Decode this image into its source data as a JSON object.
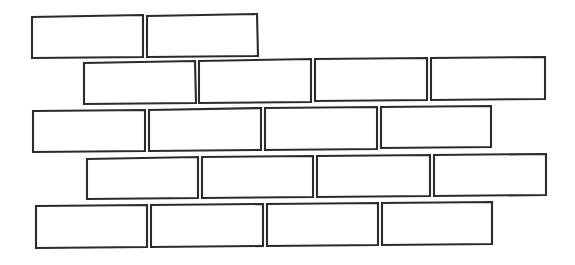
{
  "figure": {
    "name": "brick-wall-diagram",
    "style": "hand-drawn line art",
    "background_color": "#ffffff",
    "stroke_color": "#2b2b2b",
    "fill_color": "#ffffff",
    "stroke_width": 2.1,
    "width": 575,
    "height": 265,
    "row_count": 5,
    "brick_count": 18,
    "bond_pattern": "running-bond",
    "rows": [
      {
        "row_index": 1,
        "name": "brick-row-1",
        "brick_count": 2,
        "bricks": [
          {
            "name": "brick-r1-c1",
            "points": "32,17 143,15 143,57 32,58"
          },
          {
            "name": "brick-r1-c2",
            "points": "147,16 257,14 258,56 147,57"
          }
        ]
      },
      {
        "row_index": 2,
        "name": "brick-row-2",
        "brick_count": 4,
        "bricks": [
          {
            "name": "brick-r2-c1",
            "points": "84,63 195,61 196,103 84,104"
          },
          {
            "name": "brick-r2-c2",
            "points": "199,61 311,59 311,102 199,103"
          },
          {
            "name": "brick-r2-c3",
            "points": "315,59 427,58 427,100 315,101"
          },
          {
            "name": "brick-r2-c4",
            "points": "431,58 545,57 545,99 431,100"
          }
        ]
      },
      {
        "row_index": 3,
        "name": "brick-row-3",
        "brick_count": 4,
        "bricks": [
          {
            "name": "brick-r3-c1",
            "points": "33,111 145,110 145,151 33,152"
          },
          {
            "name": "brick-r3-c2",
            "points": "149,110 261,108 261,150 149,151"
          },
          {
            "name": "brick-r3-c3",
            "points": "265,108 377,107 377,149 265,150"
          },
          {
            "name": "brick-r3-c4",
            "points": "381,107 491,106 491,147 381,148"
          }
        ]
      },
      {
        "row_index": 4,
        "name": "brick-row-4",
        "brick_count": 4,
        "bricks": [
          {
            "name": "brick-r4-c1",
            "points": "87,159 198,157 198,198 87,199"
          },
          {
            "name": "brick-r4-c2",
            "points": "202,157 313,156 313,197 202,198"
          },
          {
            "name": "brick-r4-c3",
            "points": "317,156 430,155 430,196 317,197"
          },
          {
            "name": "brick-r4-c4",
            "points": "434,155 546,154 546,195 434,196"
          }
        ]
      },
      {
        "row_index": 5,
        "name": "brick-row-5",
        "brick_count": 4,
        "bricks": [
          {
            "name": "brick-r5-c1",
            "points": "36,206 147,205 147,247 36,248"
          },
          {
            "name": "brick-r5-c2",
            "points": "151,205 263,204 263,246 151,247"
          },
          {
            "name": "brick-r5-c3",
            "points": "267,204 378,203 378,245 267,246"
          },
          {
            "name": "brick-r5-c4",
            "points": "382,203 492,202 492,244 382,245"
          }
        ]
      }
    ]
  }
}
